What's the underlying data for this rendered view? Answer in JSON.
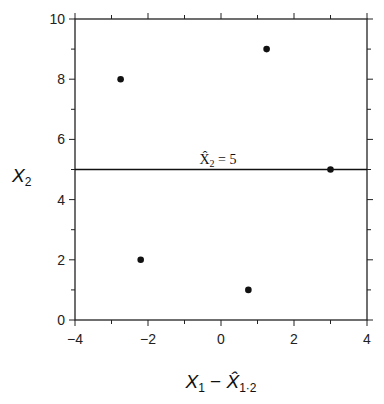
{
  "chart_data": {
    "type": "scatter",
    "title": "",
    "xlabel": "X1 − X̂1·2",
    "ylabel": "X2",
    "xlim": [
      -4,
      4
    ],
    "ylim": [
      0,
      10
    ],
    "xticks": [
      -4,
      -2,
      0,
      2,
      4
    ],
    "yticks": [
      0,
      2,
      4,
      6,
      8,
      10
    ],
    "grid": false,
    "legend": null,
    "points": [
      {
        "x": -2.75,
        "y": 8
      },
      {
        "x": 1.25,
        "y": 9
      },
      {
        "x": 3.0,
        "y": 5
      },
      {
        "x": -2.2,
        "y": 2
      },
      {
        "x": 0.75,
        "y": 1
      }
    ],
    "reference_line": {
      "type": "horizontal",
      "y": 5,
      "label": "X̂2 = 5"
    }
  },
  "labels": {
    "xticks": [
      "−4",
      "−2",
      "0",
      "2",
      "4"
    ],
    "yticks": [
      "0",
      "2",
      "4",
      "6",
      "8",
      "10"
    ],
    "ylabel_main": "X",
    "ylabel_sub": "2",
    "xlabel_main1": "X",
    "xlabel_sub1": "1",
    "xlabel_minus": " − ",
    "xlabel_main2": "X̂",
    "xlabel_sub2": "1·2",
    "annotation_main": "X̂",
    "annotation_sub": "2",
    "annotation_rest": " = 5"
  }
}
